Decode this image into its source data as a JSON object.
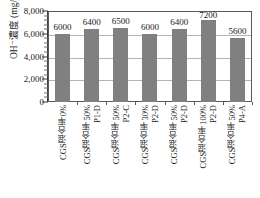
{
  "chart_data": {
    "type": "bar",
    "title": "",
    "xlabel": "",
    "ylabel": "OH⁻濃度 (mg/L)",
    "ylim": [
      0,
      8000
    ],
    "ytick_labels": [
      "8,000",
      "6,000",
      "4,000",
      "2,000",
      "0"
    ],
    "ytick_values": [
      8000,
      6000,
      4000,
      2000,
      0
    ],
    "grid": true,
    "legend": false,
    "bar_color": "#808080",
    "categories": [
      "CGS混合率0%",
      "P1-D CGS混合率50%",
      "P2-C CGS混合率50%",
      "P2-D CGS混合率30%",
      "P2-D CGS混合率50%",
      "P2-D CGS混合率100%",
      "P4-A CGS混合率50%"
    ],
    "category_parts": [
      [
        "CGS混合率0%"
      ],
      [
        "P1-D",
        "CGS混合率50%"
      ],
      [
        "P2-C",
        "CGS混合率50%"
      ],
      [
        "P2-D",
        "CGS混合率30%"
      ],
      [
        "P2-D",
        "CGS混合率50%"
      ],
      [
        "P2-D",
        "CGS混合率100%"
      ],
      [
        "P4-A",
        "CGS混合率50%"
      ]
    ],
    "values": [
      6000,
      6400,
      6500,
      6000,
      6400,
      7200,
      5600
    ],
    "value_labels": [
      "6000",
      "6400",
      "6500",
      "6000",
      "6400",
      "7200",
      "5600"
    ]
  }
}
